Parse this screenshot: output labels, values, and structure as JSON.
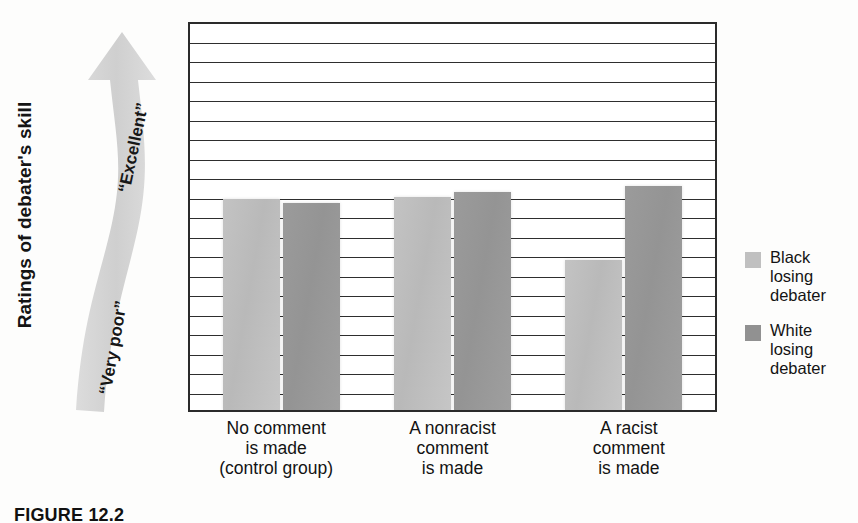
{
  "figure": {
    "caption": "FIGURE 12.2"
  },
  "axes": {
    "y_title": "Ratings of debater's skill",
    "y_tick_top": "21",
    "y_tick_bottom": "1"
  },
  "scale_arrow": {
    "top_label": "“Excellent”",
    "bottom_label": "“Very poor”",
    "icon": "curved-up-arrow-icon",
    "color": "#d4d4d4"
  },
  "legend": {
    "items": [
      {
        "key": "black-debater",
        "color": "#c0c0c0",
        "lines": [
          "Black",
          "losing",
          "debater"
        ]
      },
      {
        "key": "white-debater",
        "color": "#919191",
        "lines": [
          "White",
          "losing",
          "debater"
        ]
      }
    ]
  },
  "x_labels": [
    [
      "No comment",
      "is made",
      "(control group)"
    ],
    [
      "A nonracist",
      "comment",
      "is made"
    ],
    [
      "A racist",
      "comment",
      "is made"
    ]
  ],
  "chart_data": {
    "type": "bar",
    "title": "",
    "xlabel": "",
    "ylabel": "Ratings of debater's skill",
    "ylim": [
      1,
      21
    ],
    "grid": true,
    "gridline_step": 1,
    "legend_position": "right",
    "categories": [
      "No comment is made (control group)",
      "A nonracist comment is made",
      "A racist comment is made"
    ],
    "series": [
      {
        "name": "Black losing debater",
        "color": "#c0c0c0",
        "values": [
          11.8,
          11.9,
          8.7
        ]
      },
      {
        "name": "White losing debater",
        "color": "#919191",
        "values": [
          11.6,
          12.2,
          12.5
        ]
      }
    ],
    "annotations": [
      "“Excellent” (high end of scale)",
      "“Very poor” (low end of scale)"
    ]
  }
}
